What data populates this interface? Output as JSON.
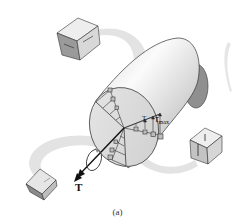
{
  "figure": {
    "caption": "(a)",
    "labels": {
      "applied_torque": "T",
      "internal_torque": "T",
      "max_shear_symbol": "τ",
      "max_shear_subscript": "max"
    },
    "components": {
      "shaft": "solid circular shaft (cylinder)",
      "cross_section": "exposed circular cross-section",
      "stress_distribution": "shear stress arrows increasing linearly from center to τmax at outer surface",
      "stress_elements": [
        {
          "position": "top-left",
          "description": "stress cube on shaft surface with shear arrows"
        },
        {
          "position": "right",
          "description": "transparent stress cube with vertical shear arrows"
        },
        {
          "position": "bottom-left",
          "description": "stress cube near torque arrow"
        }
      ],
      "torque_arrow": "double-headed axial vector with circular rotation arrow"
    },
    "colors": {
      "shaft_light": "#f2f2f2",
      "shaft_mid": "#c8c8c8",
      "shaft_dark": "#8c8c8c",
      "ribbon": "#e4e4e4",
      "line": "#222222",
      "cube_face_dark": "#8a8a8a",
      "cube_face_light": "#d6d6d6"
    }
  }
}
